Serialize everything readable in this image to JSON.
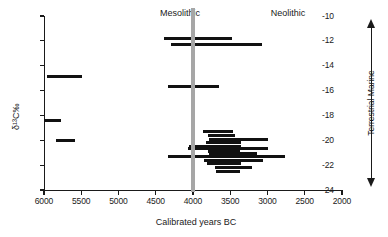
{
  "chart_data": {
    "type": "bar",
    "orientation": "horizontal-ranges",
    "title": "",
    "xlabel": "Calibrated years BC",
    "ylabel": "δ¹³C‰",
    "xlim": [
      6000,
      2000
    ],
    "ylim": [
      -24,
      -10
    ],
    "x_reversed": true,
    "grid": false,
    "legend": false,
    "xticks": [
      6000,
      5500,
      5000,
      4500,
      4000,
      3500,
      3000,
      2500,
      2000
    ],
    "xtick_labels": [
      "6000",
      "5500",
      "5000",
      "4500",
      "4000",
      "3500",
      "3000",
      "2500",
      "2000"
    ],
    "yticks": [
      -10,
      -12,
      -14,
      -16,
      -18,
      -20,
      -22,
      -24
    ],
    "ytick_labels": [
      "-10",
      "-12",
      "-14",
      "-16",
      "-18",
      "-20",
      "-22",
      "-24"
    ],
    "annotations": [
      {
        "name": "mesolithic-label",
        "text": "Mesolithic",
        "x": 5100,
        "y": -10.2
      },
      {
        "name": "neolithic-label",
        "text": "Neolithic",
        "x": 3150,
        "y": -10.2
      },
      {
        "name": "period-divider",
        "text": "",
        "x": 4000,
        "type": "vline",
        "color": "#a6a6a6"
      }
    ],
    "gradient_axis": {
      "top_label": "Marine",
      "bottom_label": "Terrestrial",
      "combined_label": "Terrestrial  Marine",
      "direction": "double-arrow"
    },
    "samples": [
      {
        "id": 1,
        "period": "Mesolithic",
        "d13C": -14.9,
        "start": 5965,
        "end": 5495
      },
      {
        "id": 2,
        "period": "Mesolithic",
        "d13C": -18.4,
        "start": 6000,
        "end": 5770
      },
      {
        "id": 3,
        "period": "Mesolithic",
        "d13C": -20.0,
        "start": 5840,
        "end": 5585
      },
      {
        "id": 4,
        "period": "Neolithic",
        "d13C": -11.8,
        "start": 4390,
        "end": 3480
      },
      {
        "id": 5,
        "period": "Neolithic",
        "d13C": -12.3,
        "start": 4300,
        "end": 3080
      },
      {
        "id": 6,
        "period": "Neolithic",
        "d13C": -15.7,
        "start": 4330,
        "end": 3650
      },
      {
        "id": 7,
        "period": "Neolithic",
        "d13C": -19.3,
        "start": 3870,
        "end": 3460
      },
      {
        "id": 8,
        "period": "Neolithic",
        "d13C": -19.6,
        "start": 3800,
        "end": 3430
      },
      {
        "id": 9,
        "period": "Neolithic",
        "d13C": -19.9,
        "start": 3790,
        "end": 2990
      },
      {
        "id": 10,
        "period": "Neolithic",
        "d13C": -20.2,
        "start": 3830,
        "end": 3360
      },
      {
        "id": 11,
        "period": "Neolithic",
        "d13C": -20.5,
        "start": 4060,
        "end": 3350
      },
      {
        "id": 12,
        "period": "Neolithic",
        "d13C": -20.7,
        "start": 4070,
        "end": 2990
      },
      {
        "id": 13,
        "period": "Neolithic",
        "d13C": -20.9,
        "start": 3800,
        "end": 3370
      },
      {
        "id": 14,
        "period": "Neolithic",
        "d13C": -21.1,
        "start": 3780,
        "end": 3140
      },
      {
        "id": 15,
        "period": "Neolithic",
        "d13C": -21.3,
        "start": 4330,
        "end": 2760
      },
      {
        "id": 16,
        "period": "Neolithic",
        "d13C": -21.6,
        "start": 3850,
        "end": 3060
      },
      {
        "id": 17,
        "period": "Neolithic",
        "d13C": -21.9,
        "start": 3810,
        "end": 3350
      },
      {
        "id": 18,
        "period": "Neolithic",
        "d13C": -22.2,
        "start": 3700,
        "end": 3210
      },
      {
        "id": 19,
        "period": "Neolithic",
        "d13C": -22.5,
        "start": 3690,
        "end": 3370
      }
    ]
  }
}
